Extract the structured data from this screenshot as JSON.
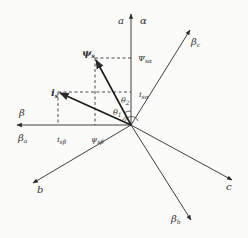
{
  "diagram": {
    "type": "vector-phasor-diagram",
    "origin": {
      "x": 131,
      "y": 125
    },
    "colors": {
      "line": "#2a2a2a",
      "dashed": "#222222",
      "background": "#fbfbfa",
      "text": "#333333"
    },
    "axes": [
      {
        "id": "alpha",
        "labels": [
          {
            "main": "a",
            "sub": ""
          },
          {
            "main": "α",
            "sub": ""
          }
        ],
        "to": {
          "x": 131,
          "y": 14
        }
      },
      {
        "id": "beta",
        "labels": [
          {
            "main": "β",
            "sub": ""
          },
          {
            "main": "β",
            "sub": "a"
          }
        ],
        "to": {
          "x": 17,
          "y": 125
        }
      },
      {
        "id": "beta_c",
        "labels": [
          {
            "main": "β",
            "sub": "c"
          }
        ],
        "to": {
          "x": 190,
          "y": 30
        }
      },
      {
        "id": "b",
        "labels": [
          {
            "main": "b",
            "sub": ""
          }
        ],
        "to": {
          "x": 33,
          "y": 183
        }
      },
      {
        "id": "c",
        "labels": [
          {
            "main": "c",
            "sub": ""
          }
        ],
        "to": {
          "x": 232,
          "y": 180
        }
      },
      {
        "id": "beta_b",
        "labels": [
          {
            "main": "β",
            "sub": "b"
          }
        ],
        "to": {
          "x": 191,
          "y": 220
        }
      }
    ],
    "vectors": [
      {
        "id": "psi_s",
        "label": {
          "main": "ψ",
          "sub": "s"
        },
        "to": {
          "x": 95,
          "y": 58
        }
      },
      {
        "id": "i_s",
        "label": {
          "main": "i",
          "sub": "s"
        },
        "to": {
          "x": 58,
          "y": 92
        }
      }
    ],
    "projections": [
      {
        "label": {
          "main": "Ψ",
          "sub": "sα"
        }
      },
      {
        "label": {
          "main": "i",
          "sub": "sα"
        }
      },
      {
        "label": {
          "main": "i",
          "sub": "sβ"
        }
      },
      {
        "label": {
          "main": "ψ",
          "sub": "sβ"
        }
      }
    ],
    "angles": [
      {
        "label": {
          "main": "θ",
          "sub": "1"
        }
      },
      {
        "label": {
          "main": "θ",
          "sub": "2"
        }
      }
    ]
  }
}
